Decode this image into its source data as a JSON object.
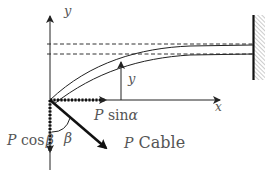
{
  "diagram": {
    "axes": {
      "x_label": "x",
      "y_label": "y"
    },
    "deflection_label": "y",
    "force_components": {
      "horizontal_P": "P",
      "horizontal_fn": "sin",
      "horizontal_angle": "α",
      "vertical_P": "P",
      "vertical_fn": "cos",
      "vertical_angle": "β"
    },
    "angle_label": "β",
    "cable": {
      "force_symbol": "P",
      "label": "Cable"
    },
    "colors": {
      "line": "#222222",
      "text": "#555555",
      "hatch": "#999999"
    }
  }
}
